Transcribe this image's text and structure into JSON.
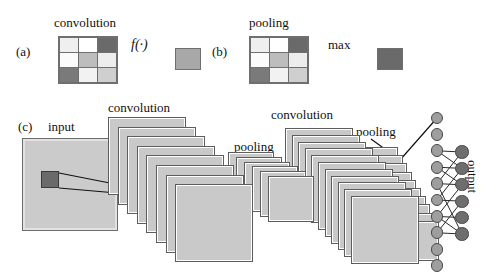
{
  "figure": {
    "panels": {
      "a": {
        "id": "(a)",
        "operation_label": "convolution",
        "function_symbol": "f(·)",
        "matrix": [
          [
            "#efefef",
            "#ffffff",
            "#6a6a6a"
          ],
          [
            "#fbfbfb",
            "#bdbdbd",
            "#ededed"
          ],
          [
            "#7a7a7a",
            "#f2f2f2",
            "#cfcfcf"
          ]
        ],
        "result_color": "#a8a8a8"
      },
      "b": {
        "id": "(b)",
        "operation_label": "pooling",
        "function_symbol": "max",
        "matrix": [
          [
            "#efefef",
            "#ffffff",
            "#6a6a6a"
          ],
          [
            "#fbfbfb",
            "#bdbdbd",
            "#ededed"
          ],
          [
            "#7a7a7a",
            "#f2f2f2",
            "#cfcfcf"
          ]
        ],
        "result_color": "#6a6a6a"
      },
      "c": {
        "id": "(c)",
        "input_label": "input",
        "conv1_label": "convolution",
        "pool1_label": "pooling",
        "conv2_label": "convolution",
        "pool2_label": "pooling",
        "output_label": "output",
        "stacks": [
          {
            "name": "conv1",
            "count": 8
          },
          {
            "name": "pool1",
            "count": 6
          },
          {
            "name": "conv2",
            "count": 11
          },
          {
            "name": "pool2",
            "count": 10
          }
        ]
      }
    },
    "colors": {
      "plate_fill": "#c9c9c9",
      "plate_edge": "#5d5d5d",
      "patch_fill": "#6a6a6a",
      "node_light": "#9e9e9e",
      "node_dark": "#6e6e6e",
      "stroke": "#111111",
      "background": "#ffffff"
    },
    "network": {
      "hidden_layer_count": 10,
      "output_layer_count": 6
    }
  }
}
